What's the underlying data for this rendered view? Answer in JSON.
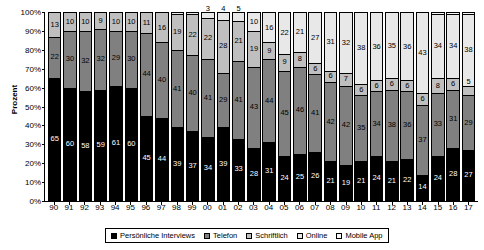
{
  "chart_data": {
    "type": "bar",
    "subtype": "stacked-percentage",
    "title": "",
    "xlabel": "",
    "ylabel": "Prozent",
    "ylim": [
      0,
      100
    ],
    "ytick_labels": [
      "100%",
      "90%",
      "80%",
      "70%",
      "60%",
      "50%",
      "40%",
      "30%",
      "20%",
      "10%",
      "0%"
    ],
    "ytick_values": [
      100,
      90,
      80,
      70,
      60,
      50,
      40,
      30,
      20,
      10,
      0
    ],
    "grid": false,
    "legend_position": "bottom",
    "categories": [
      "90",
      "91",
      "92",
      "93",
      "94",
      "95",
      "96",
      "97",
      "98",
      "99",
      "00",
      "01",
      "02",
      "03",
      "04",
      "05",
      "06",
      "07",
      "08",
      "09",
      "10",
      "11",
      "12",
      "13",
      "14",
      "15",
      "16",
      "17"
    ],
    "series": [
      {
        "name": "Persönliche Interviews",
        "color": "#000000",
        "values": [
          65,
          60,
          58,
          59,
          61,
          60,
          45,
          44,
          39,
          37,
          34,
          39,
          33,
          28,
          31,
          24,
          25,
          26,
          21,
          19,
          21,
          24,
          21,
          22,
          14,
          24,
          28,
          27
        ]
      },
      {
        "name": "Telefon",
        "color": "#808080",
        "values": [
          22,
          30,
          32,
          32,
          29,
          30,
          44,
          40,
          41,
          40,
          41,
          29,
          41,
          43,
          44,
          45,
          46,
          41,
          42,
          42,
          35,
          34,
          38,
          36,
          37,
          33,
          31,
          29
        ]
      },
      {
        "name": "Schriftlich",
        "color": "#bfbfbf",
        "values": [
          13,
          10,
          10,
          9,
          10,
          10,
          11,
          16,
          19,
          22,
          22,
          28,
          21,
          19,
          9,
          9,
          8,
          6,
          6,
          7,
          6,
          6,
          6,
          6,
          6,
          8,
          6,
          5
        ]
      },
      {
        "name": "Online",
        "color": "#e8e8e8",
        "values": [
          0,
          0,
          0,
          0,
          0,
          0,
          0,
          0,
          1,
          1,
          3,
          4,
          5,
          10,
          16,
          22,
          21,
          27,
          31,
          32,
          38,
          36,
          35,
          36,
          43,
          34,
          34,
          38
        ]
      },
      {
        "name": "Mobile App",
        "color": "#f7f7f7",
        "values": [
          0,
          0,
          0,
          0,
          0,
          0,
          0,
          0,
          0,
          0,
          0,
          0,
          0,
          0,
          0,
          0,
          0,
          0,
          0,
          0,
          0,
          0,
          0,
          0,
          0,
          1,
          1,
          1
        ]
      }
    ],
    "labels": {
      "persoenliche": [
        "65",
        "60",
        "58",
        "59",
        "61",
        "60",
        "45",
        "44",
        "39",
        "37",
        "34",
        "39",
        "33",
        "28",
        "31",
        "24",
        "25",
        "26",
        "21",
        "19",
        "21",
        "24",
        "21",
        "22",
        "14",
        "24",
        "28",
        "27"
      ],
      "telefon": [
        "22",
        "30",
        "32",
        "32",
        "29",
        "30",
        "44",
        "40",
        "41",
        "40",
        "41",
        "29",
        "41",
        "43",
        "44",
        "45",
        "46",
        "41",
        "42",
        "42",
        "35",
        "34",
        "38",
        "36",
        "37",
        "33",
        "31",
        "29"
      ],
      "schriftlich": [
        "13",
        "10",
        "10",
        "9",
        "10",
        "10",
        "11",
        "16",
        "19",
        "22",
        "22",
        "28",
        "21",
        "19",
        "9",
        "9",
        "8",
        "6",
        "6",
        "7",
        "6",
        "6",
        "6",
        "6",
        "6",
        "8",
        "6",
        "5"
      ],
      "online": [
        "",
        "",
        "",
        "",
        "",
        "",
        "",
        "",
        "",
        "",
        "3",
        "4",
        "5",
        "10",
        "16",
        "22",
        "21",
        "27",
        "31",
        "32",
        "38",
        "36",
        "35",
        "36",
        "43",
        "34",
        "34",
        "38"
      ],
      "mobile": [
        "",
        "",
        "",
        "",
        "",
        "",
        "",
        "",
        "",
        "",
        "",
        "",
        "",
        "",
        "",
        "",
        "",
        "",
        "",
        "",
        "",
        "",
        "",
        "",
        "",
        "",
        "",
        ""
      ]
    }
  },
  "legend": {
    "items": [
      {
        "label": "Persönliche Interviews",
        "color": "#000000"
      },
      {
        "label": "Telefon",
        "color": "#808080"
      },
      {
        "label": "Schriftlich",
        "color": "#bfbfbf"
      },
      {
        "label": "Online",
        "color": "#e8e8e8"
      },
      {
        "label": "Mobile App",
        "color": "#f7f7f7"
      }
    ]
  }
}
